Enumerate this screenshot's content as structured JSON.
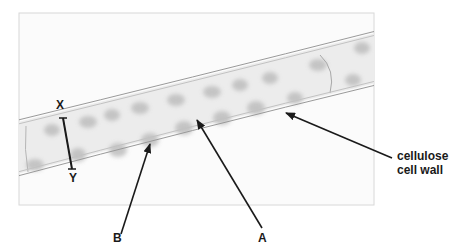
{
  "figure": {
    "type": "labelled micrograph diagram",
    "labels": {
      "x": "X",
      "y": "Y",
      "a": "A",
      "b": "B",
      "wall_line1": "cellulose",
      "wall_line2": "cell wall"
    },
    "annotations": [
      {
        "id": "X-Y",
        "description": "width measurement bar across the cell"
      },
      {
        "id": "A",
        "points_to": "cell structure (chloroplast region)"
      },
      {
        "id": "B",
        "points_to": "cell structure (cytoplasm region)"
      },
      {
        "id": "cellulose cell wall",
        "points_to": "outer wall of filament"
      }
    ],
    "colors": {
      "frame_border": "#d8d8d8",
      "wall_line": "#9a9a9a",
      "cell_fill": "#e9e9e9",
      "blob": "#b9b9b9",
      "arrow": "#1a1a1a"
    }
  }
}
